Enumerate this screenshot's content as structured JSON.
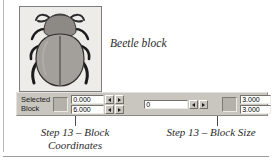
{
  "figure": {
    "caption": "Beetle block",
    "alt_name": "beetle-illustration"
  },
  "toolbar": {
    "selected_block_label_line1": "Selected",
    "selected_block_label_line2": "Block",
    "color_swatch_left": "#b4b1ab",
    "color_swatch_right": "#b4b1ab",
    "coordinates": {
      "x_value": "0.000",
      "y_value": "6.000"
    },
    "middle_field": {
      "value": "0"
    },
    "block_size": {
      "width_value": "3.000",
      "height_value": "3.000"
    },
    "spinner_down_icon": "spin-down-arrow",
    "spinner_up_icon": "spin-up-arrow"
  },
  "annotations": {
    "left_caption_line1": "Step 13 – Block",
    "left_caption_line2": "Coordinates",
    "right_caption": "Step 13 – Block Size"
  },
  "colors": {
    "toolbar_face": "#c9c6c0",
    "field_background": "#ffffff",
    "figure_background": "#eceae6",
    "rule": "#9a9a9a"
  }
}
